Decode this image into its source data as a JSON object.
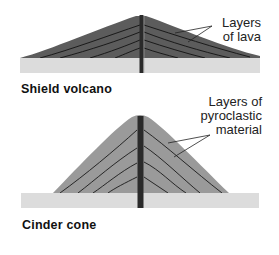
{
  "diagrams": [
    {
      "id": "shield",
      "title": "Shield volcano",
      "annotation_lines": [
        "Layers",
        "of lava"
      ]
    },
    {
      "id": "cinder",
      "title": "Cinder cone",
      "annotation_lines": [
        "Layers of",
        "pyroclastic",
        "material"
      ]
    }
  ],
  "colors": {
    "lava_layers": "#5c5c5c",
    "pyroclastic_layers": "#9a9a9a",
    "ground": "#dcdcdc",
    "conduit": "#2a2a2a",
    "layer_lines": "#1a1a1a"
  }
}
